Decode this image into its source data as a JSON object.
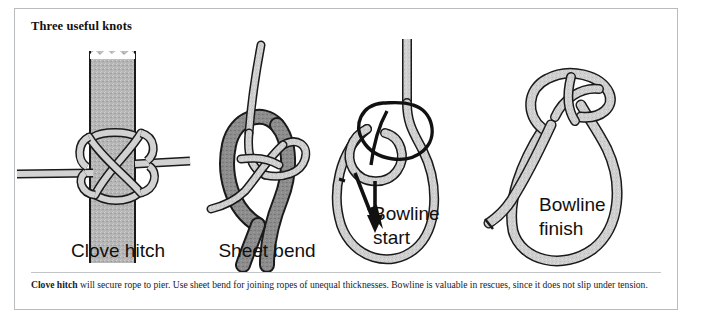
{
  "figure": {
    "title": "Three useful knots",
    "caption_lead": "Clove hitch",
    "caption_rest": " will secure rope to pier. Use sheet bend for joining ropes of unequal thicknesses. Bowline is valuable in rescues, since it does not slip under tension."
  },
  "knots": [
    {
      "id": "clove-hitch",
      "label": "Clove hitch",
      "label_line1": "Clove hitch",
      "label_line2": ""
    },
    {
      "id": "sheet-bend",
      "label": "Sheet bend",
      "label_line1": "Sheet bend",
      "label_line2": ""
    },
    {
      "id": "bowline-start",
      "label": "Bowline start",
      "label_line1": "Bowline",
      "label_line2": "start"
    },
    {
      "id": "bowline-finish",
      "label": "Bowline finish",
      "label_line1": "Bowline",
      "label_line2": "finish"
    }
  ],
  "colors": {
    "rope_light": "#cfcfcf",
    "rope_dark": "#8d8d8d",
    "post_gray": "#b3b3b3",
    "ink": "#111111",
    "border": "#b9bcbe",
    "page": "#ffffff"
  }
}
